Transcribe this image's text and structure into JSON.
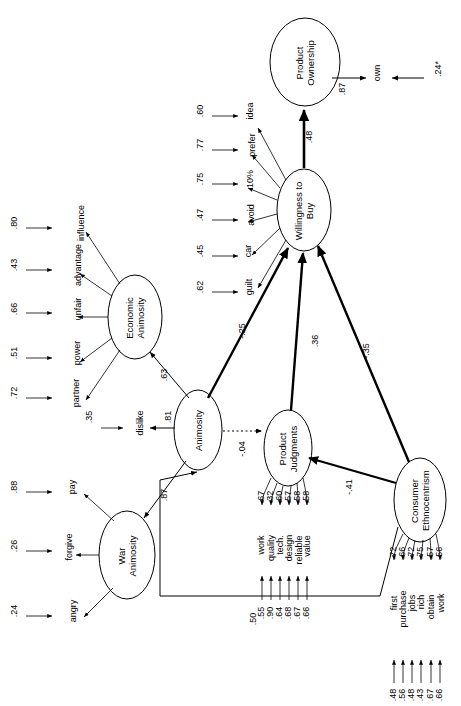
{
  "diagram": {
    "type": "structural-equation-model",
    "orientation": "rotated-90-ccw",
    "constructs": [
      {
        "id": "product_ownership",
        "label": "Product\nOwnership",
        "line1": "Product",
        "line2": "Ownership"
      },
      {
        "id": "willingness_to_buy",
        "label": "Willingness to Buy",
        "line1": "Willingness to",
        "line2": "Buy"
      },
      {
        "id": "economic_animosity",
        "label": "Economic Animosity",
        "line1": "Economic",
        "line2": "Animosity"
      },
      {
        "id": "war_animosity",
        "label": "War Animosity",
        "line1": "War",
        "line2": "Animosity"
      },
      {
        "id": "animosity",
        "label": "Animosity",
        "line1": "Animosity",
        "line2": ""
      },
      {
        "id": "product_judgments",
        "label": "Product Judgments",
        "line1": "Product",
        "line2": "Judgments"
      },
      {
        "id": "consumer_ethnocentrism",
        "label": "Consumer Ethnocentrism",
        "line1": "Consumer",
        "line2": "Ethnocentrism"
      }
    ],
    "indicators": {
      "product_ownership": [
        {
          "name": "own",
          "loading": ".87",
          "error": ".24*"
        }
      ],
      "willingness_to_buy": [
        {
          "name": "guilt",
          "error": ".62"
        },
        {
          "name": "car",
          "error": ".45"
        },
        {
          "name": "avoid",
          "error": ".47"
        },
        {
          "name": "10%",
          "error": ".75"
        },
        {
          "name": "prefer",
          "error": ".77"
        },
        {
          "name": "idea",
          "error": ".60"
        }
      ],
      "economic_animosity": [
        {
          "name": "partner",
          "error": ".72"
        },
        {
          "name": "power",
          "error": ".51"
        },
        {
          "name": "unfair",
          "error": ".66"
        },
        {
          "name": "advantage",
          "error": ".43"
        },
        {
          "name": "influence",
          "error": ".80"
        }
      ],
      "war_animosity": [
        {
          "name": "angry",
          "error": ".24"
        },
        {
          "name": "forgive",
          "error": ".26"
        },
        {
          "name": "pay",
          "error": ".88"
        }
      ],
      "animosity": [
        {
          "name": "dislike",
          "loading": ".81",
          "error": ".35"
        }
      ],
      "product_judgments": [
        {
          "name": "work",
          "loading": ".67",
          "error": ".55"
        },
        {
          "name": "quality",
          "loading": ".32",
          "error": ".90"
        },
        {
          "name": "tech.",
          "loading": ".60",
          "error": ".64"
        },
        {
          "name": "design",
          "loading": ".57",
          "error": ".68"
        },
        {
          "name": "reliable",
          "loading": ".58",
          "error": ".67"
        },
        {
          "name": "value",
          "loading": ".58",
          "error": ".66"
        }
      ],
      "consumer_ethnocentrism": [
        {
          "name": "first",
          "loading": ".72",
          "error": ".48"
        },
        {
          "name": "purchase",
          "loading": ".66",
          "error": ".56"
        },
        {
          "name": "jobs",
          "loading": ".72",
          "error": ".48"
        },
        {
          "name": "rich",
          "loading": ".75",
          "error": ".43"
        },
        {
          "name": "obtain",
          "loading": ".57",
          "error": ".67"
        },
        {
          "name": "work",
          "loading": ".56",
          "error": ".66"
        }
      ]
    },
    "paths": [
      {
        "id": "wtb_to_ownership",
        "from": "willingness_to_buy",
        "to": "product_ownership",
        "coef": ".48",
        "style": "bold"
      },
      {
        "id": "animosity_to_wtb",
        "from": "animosity",
        "to": "willingness_to_buy",
        "coef": "-.25",
        "style": "bold"
      },
      {
        "id": "pj_to_wtb",
        "from": "product_judgments",
        "to": "willingness_to_buy",
        "coef": ".36",
        "style": "bold"
      },
      {
        "id": "ce_to_wtb",
        "from": "consumer_ethnocentrism",
        "to": "willingness_to_buy",
        "coef": "-.35",
        "style": "bold"
      },
      {
        "id": "animosity_to_pj",
        "from": "animosity",
        "to": "product_judgments",
        "coef": "-.04",
        "style": "dotted"
      },
      {
        "id": "ce_to_pj",
        "from": "consumer_ethnocentrism",
        "to": "product_judgments",
        "coef": "-.41",
        "style": "bold"
      },
      {
        "id": "ce_to_animosity",
        "from": "consumer_ethnocentrism",
        "to": "animosity",
        "coef": ".50",
        "style": "thin"
      },
      {
        "id": "animosity_to_econ",
        "from": "animosity",
        "to": "economic_animosity",
        "coef": ".63",
        "style": "thin"
      },
      {
        "id": "animosity_to_war",
        "from": "animosity",
        "to": "war_animosity",
        "coef": ".87",
        "style": "thin"
      }
    ],
    "coef_labels": {
      "c48": ".48",
      "c87own": ".87",
      "c24own": ".24*",
      "c25": "-.25",
      "c36": ".36",
      "c35": "-.35",
      "c04": "-.04",
      "c41": "-.41",
      "c50": ".50",
      "c63": ".63",
      "c87": ".87",
      "c81": ".81",
      "c35dis": ".35"
    }
  }
}
